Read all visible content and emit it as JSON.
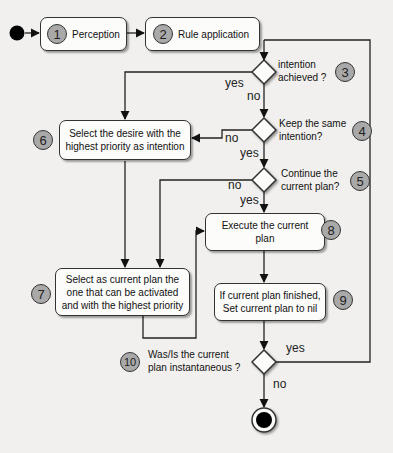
{
  "diagram": {
    "type": "activity-flowchart",
    "start": {
      "id": "start"
    },
    "end": {
      "id": "end"
    },
    "nodes": [
      {
        "id": "1",
        "type": "action",
        "number": "1",
        "label": "Perception"
      },
      {
        "id": "2",
        "type": "action",
        "number": "2",
        "label": "Rule application"
      },
      {
        "id": "3",
        "type": "decision",
        "number": "3",
        "label_line1": "intention",
        "label_line2": "achieved ?"
      },
      {
        "id": "4",
        "type": "decision",
        "number": "4",
        "label_line1": "Keep the same",
        "label_line2": "intention?"
      },
      {
        "id": "5",
        "type": "decision",
        "number": "5",
        "label_line1": "Continue the",
        "label_line2": "current plan?"
      },
      {
        "id": "6",
        "type": "action",
        "number": "6",
        "label_line1": "Select the desire with the",
        "label_line2": "highest priority as intention"
      },
      {
        "id": "7",
        "type": "action",
        "number": "7",
        "label_line1": "Select as current plan the",
        "label_line2": "one that can be activated",
        "label_line3": "and with the highest priority"
      },
      {
        "id": "8",
        "type": "action",
        "number": "8",
        "label_line1": "Execute the current",
        "label_line2": "plan"
      },
      {
        "id": "9",
        "type": "action",
        "number": "9",
        "label_line1": "If current plan finished,",
        "label_line2": "Set current plan to nil"
      },
      {
        "id": "10",
        "type": "decision",
        "number": "10",
        "label_line1": "Was/Is the current",
        "label_line2": "plan instantaneous ?"
      }
    ],
    "edges": [
      {
        "from": "start",
        "to": "1",
        "label": ""
      },
      {
        "from": "1",
        "to": "2",
        "label": ""
      },
      {
        "from": "2",
        "to": "3",
        "label": ""
      },
      {
        "from": "3",
        "to": "6",
        "label": "yes"
      },
      {
        "from": "3",
        "to": "4",
        "label": "no"
      },
      {
        "from": "4",
        "to": "6",
        "label": "no"
      },
      {
        "from": "4",
        "to": "5",
        "label": "yes"
      },
      {
        "from": "5",
        "to": "7",
        "label": "no"
      },
      {
        "from": "5",
        "to": "8",
        "label": "yes"
      },
      {
        "from": "6",
        "to": "7",
        "label": ""
      },
      {
        "from": "7",
        "to": "8",
        "label": ""
      },
      {
        "from": "8",
        "to": "9",
        "label": ""
      },
      {
        "from": "9",
        "to": "10",
        "label": ""
      },
      {
        "from": "10",
        "to": "2",
        "label": "yes"
      },
      {
        "from": "10",
        "to": "end",
        "label": "no"
      }
    ],
    "edge_labels": {
      "yes_3": "yes",
      "no_3": "no",
      "no_4": "no",
      "yes_4": "yes",
      "no_5": "no",
      "yes_5": "yes",
      "yes_10": "yes",
      "no_10": "no"
    },
    "colors": {
      "background": "#f1f0ee",
      "node_fill": "#fcfcfb",
      "stroke": "#333333",
      "badge_fill": "#a9a9a9",
      "terminal": "#000000"
    }
  }
}
